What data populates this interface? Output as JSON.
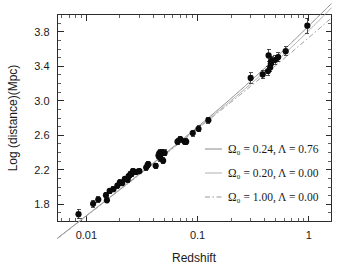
{
  "chart_data": {
    "type": "scatter",
    "title": "",
    "xlabel": "Redshift",
    "ylabel": "Log (distance)(Mpc)",
    "xscale": "log",
    "yscale": "linear",
    "xlim": [
      0.0055,
      1.6
    ],
    "ylim": [
      1.6,
      4.0
    ],
    "grid": false,
    "xticklabels": [
      "0.01",
      "0.1",
      "1"
    ],
    "xtickvalues": [
      0.01,
      0.1,
      1
    ],
    "yticklabels": [
      "1.8",
      "2.2",
      "2.6",
      "3.0",
      "3.4",
      "3.8"
    ],
    "ytickvalues": [
      1.8,
      2.2,
      2.6,
      3.0,
      3.4,
      3.8
    ],
    "legend_position": "lower-right-inside",
    "series": [
      {
        "name": "supernova-data",
        "type": "scatter",
        "marker": "filled-circle",
        "color": "#0a0a0a",
        "points": [
          {
            "x": 0.0085,
            "y": 1.685,
            "yerr": 0.055
          },
          {
            "x": 0.0115,
            "y": 1.805,
            "yerr": 0.04
          },
          {
            "x": 0.0128,
            "y": 1.855,
            "yerr": 0.03
          },
          {
            "x": 0.015,
            "y": 1.905,
            "yerr": 0.03
          },
          {
            "x": 0.0153,
            "y": 1.845,
            "yerr": 0.03
          },
          {
            "x": 0.0162,
            "y": 1.955,
            "yerr": 0.03
          },
          {
            "x": 0.0175,
            "y": 1.975,
            "yerr": 0.03
          },
          {
            "x": 0.019,
            "y": 2.015,
            "yerr": 0.03
          },
          {
            "x": 0.02,
            "y": 2.055,
            "yerr": 0.03
          },
          {
            "x": 0.021,
            "y": 2.045,
            "yerr": 0.03
          },
          {
            "x": 0.0222,
            "y": 2.095,
            "yerr": 0.03
          },
          {
            "x": 0.0235,
            "y": 2.085,
            "yerr": 0.03
          },
          {
            "x": 0.024,
            "y": 2.125,
            "yerr": 0.03
          },
          {
            "x": 0.0248,
            "y": 2.145,
            "yerr": 0.03
          },
          {
            "x": 0.0255,
            "y": 2.155,
            "yerr": 0.03
          },
          {
            "x": 0.0262,
            "y": 2.185,
            "yerr": 0.03
          },
          {
            "x": 0.028,
            "y": 2.175,
            "yerr": 0.03
          },
          {
            "x": 0.03,
            "y": 2.185,
            "yerr": 0.03
          },
          {
            "x": 0.0345,
            "y": 2.225,
            "yerr": 0.03
          },
          {
            "x": 0.0355,
            "y": 2.255,
            "yerr": 0.03
          },
          {
            "x": 0.036,
            "y": 2.265,
            "yerr": 0.03
          },
          {
            "x": 0.042,
            "y": 2.245,
            "yerr": 0.03
          },
          {
            "x": 0.0445,
            "y": 2.365,
            "yerr": 0.035
          },
          {
            "x": 0.0455,
            "y": 2.395,
            "yerr": 0.035
          },
          {
            "x": 0.0462,
            "y": 2.335,
            "yerr": 0.035
          },
          {
            "x": 0.0468,
            "y": 2.385,
            "yerr": 0.035
          },
          {
            "x": 0.0475,
            "y": 2.405,
            "yerr": 0.035
          },
          {
            "x": 0.049,
            "y": 2.305,
            "yerr": 0.035
          },
          {
            "x": 0.0505,
            "y": 2.395,
            "yerr": 0.035
          },
          {
            "x": 0.066,
            "y": 2.525,
            "yerr": 0.035
          },
          {
            "x": 0.07,
            "y": 2.555,
            "yerr": 0.035
          },
          {
            "x": 0.0765,
            "y": 2.525,
            "yerr": 0.035
          },
          {
            "x": 0.079,
            "y": 2.525,
            "yerr": 0.035
          },
          {
            "x": 0.0905,
            "y": 2.625,
            "yerr": 0.035
          },
          {
            "x": 0.102,
            "y": 2.675,
            "yerr": 0.035
          },
          {
            "x": 0.125,
            "y": 2.775,
            "yerr": 0.035
          },
          {
            "x": 0.3,
            "y": 3.265,
            "yerr": 0.06
          },
          {
            "x": 0.385,
            "y": 3.305,
            "yerr": 0.05
          },
          {
            "x": 0.43,
            "y": 3.345,
            "yerr": 0.05
          },
          {
            "x": 0.435,
            "y": 3.525,
            "yerr": 0.075
          },
          {
            "x": 0.45,
            "y": 3.385,
            "yerr": 0.05
          },
          {
            "x": 0.455,
            "y": 3.425,
            "yerr": 0.05
          },
          {
            "x": 0.46,
            "y": 3.455,
            "yerr": 0.05
          },
          {
            "x": 0.465,
            "y": 3.465,
            "yerr": 0.05
          },
          {
            "x": 0.5,
            "y": 3.475,
            "yerr": 0.05
          },
          {
            "x": 0.53,
            "y": 3.505,
            "yerr": 0.05
          },
          {
            "x": 0.62,
            "y": 3.575,
            "yerr": 0.05
          },
          {
            "x": 0.97,
            "y": 3.87,
            "yerr": 0.085
          }
        ]
      }
    ],
    "model_curves": [
      {
        "id": "model_a",
        "label": "Ω₀ = 0.24, Λ = 0.76",
        "omega0": 0.24,
        "lambda": 0.76,
        "linestyle": "solid",
        "color": "#8a8a8a"
      },
      {
        "id": "model_b",
        "label": "Ω₀ = 0.20, Λ = 0.00",
        "omega0": 0.2,
        "lambda": 0.0,
        "linestyle": "solid-light",
        "color": "#b0b0b0"
      },
      {
        "id": "model_c",
        "label": "Ω₀ = 1.00, Λ = 0.00",
        "omega0": 1.0,
        "lambda": 0.0,
        "linestyle": "dash-dot",
        "color": "#9a9a9a"
      }
    ]
  },
  "axes": {
    "xlabel": "Redshift",
    "ylabel": "Log (distance)(Mpc)",
    "xtick_0": "0.01",
    "xtick_1": "0.1",
    "xtick_2": "1",
    "ytick_0": "1.8",
    "ytick_1": "2.2",
    "ytick_2": "2.6",
    "ytick_3": "3.0",
    "ytick_4": "3.4",
    "ytick_5": "3.8"
  },
  "legend": {
    "entry_0": "Ω₀ = 0.24, Λ = 0.76",
    "entry_1": "Ω₀ = 0.20, Λ = 0.00",
    "entry_2": "Ω₀ = 1.00, Λ = 0.00"
  },
  "colors": {
    "background": "#ffffff",
    "axis": "#2b2b2b",
    "marker": "#0a0a0a",
    "model_a": "#8a8a8a",
    "model_b": "#b0b0b0",
    "model_c": "#9a9a9a"
  }
}
